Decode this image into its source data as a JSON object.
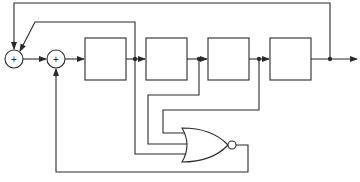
{
  "diagram": {
    "type": "block-diagram",
    "stroke_color": "#2a2a2a",
    "background": "#ffffff",
    "adders": [
      {
        "id": "adder-1",
        "symbol": "+",
        "cx": 14,
        "cy": 59,
        "r": 9
      },
      {
        "id": "adder-2",
        "symbol": "+",
        "cx": 56,
        "cy": 59,
        "r": 9
      }
    ],
    "registers": [
      {
        "id": "stage-1",
        "x": 85,
        "y": 38,
        "w": 41,
        "h": 42
      },
      {
        "id": "stage-2",
        "x": 146,
        "y": 38,
        "w": 41,
        "h": 42
      },
      {
        "id": "stage-3",
        "x": 208,
        "y": 38,
        "w": 41,
        "h": 42
      },
      {
        "id": "stage-4",
        "x": 270,
        "y": 38,
        "w": 41,
        "h": 42
      }
    ],
    "nor_gate": {
      "id": "nor-gate",
      "inputs": 3,
      "output_bubble": true
    }
  }
}
